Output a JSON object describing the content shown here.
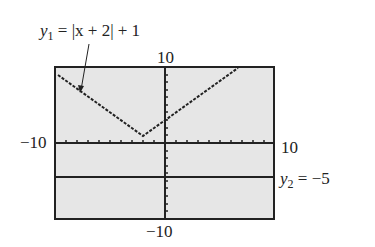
{
  "equation1": {
    "var": "y",
    "sub": "1",
    "rhs": " = |x + 2| + 1"
  },
  "equation2": {
    "var": "y",
    "sub": "2",
    "rhs": " = −5"
  },
  "window": {
    "ymax": "10",
    "ymin": "−10",
    "xmin": "−10",
    "xmax": "10"
  },
  "colors": {
    "screen": "#e6e6e6",
    "ink": "#222222"
  }
}
